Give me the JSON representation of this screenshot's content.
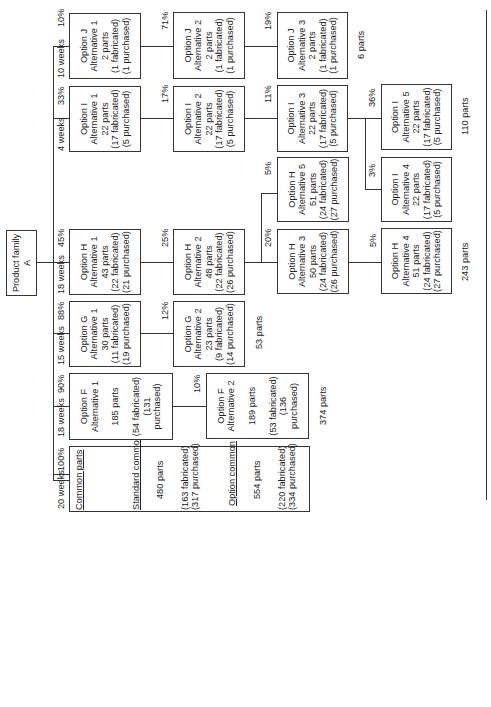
{
  "root": {
    "label": "Product family A"
  },
  "columns": [
    {
      "weeks": "20 weeks",
      "pct": "100%"
    },
    {
      "weeks": "18 weeks",
      "pct": "90%"
    },
    {
      "weeks": "15 weeks",
      "pct": "88%"
    },
    {
      "weeks": "18 weeks",
      "pct": "45%"
    },
    {
      "weeks": "4 weeks",
      "pct": "33%"
    },
    {
      "weeks": "10 weeks",
      "pct": "10%"
    }
  ],
  "common": {
    "title": "Common parts",
    "standard": {
      "title": "Standard common",
      "parts": "480 parts",
      "fab": "(163 fabricated)",
      "pur": "(317 purchased)"
    },
    "option": {
      "title": "Option common",
      "parts": "554 parts",
      "fab": "(220 fabricated)",
      "pur": "(334 purchased)"
    }
  },
  "boxes": {
    "F1": {
      "opt": "Option F",
      "alt": "Alternative 1",
      "parts": "185 parts",
      "fab": "(54 fabricated)",
      "pur": "(131 purchased)"
    },
    "F2": {
      "opt": "Option F",
      "alt": "Alternative 2",
      "parts": "189 parts",
      "fab": "(53 fabricated)",
      "pur": "(136 purchased)",
      "pct": "10%"
    },
    "G1": {
      "opt": "Option G",
      "alt": "Alternative 1",
      "parts": "30 parts",
      "fab": "(11 fabricated)",
      "pur": "(19 purchased)"
    },
    "G2": {
      "opt": "Option G",
      "alt": "Alternative 2",
      "parts": "23 parts",
      "fab": "(9 fabricated)",
      "pur": "(14 purchased)",
      "pct": "12%"
    },
    "H1": {
      "opt": "Option H",
      "alt": "Alternative 1",
      "parts": "43 parts",
      "fab": "(22 fabricated)",
      "pur": "(21 purchased)"
    },
    "H2": {
      "opt": "Option H",
      "alt": "Alternative 2",
      "parts": "48 parts",
      "fab": "(22 fabricated)",
      "pur": "(26 purchased)",
      "pct": "25%"
    },
    "H3": {
      "opt": "Option H",
      "alt": "Alternative 3",
      "parts": "50 parts",
      "fab": "(24 fabricated)",
      "pur": "(26 purchased)",
      "pct": "20%"
    },
    "H4": {
      "opt": "Option H",
      "alt": "Alternative 4",
      "parts": "51 parts",
      "fab": "(24 fabricated)",
      "pur": "(27 purchased)",
      "pct": "5%"
    },
    "H5": {
      "opt": "Option H",
      "alt": "Alternative 5",
      "parts": "51 parts",
      "fab": "(24 fabricated)",
      "pur": "(27 purchased)",
      "pct": "5%"
    },
    "I1": {
      "opt": "Option I",
      "alt": "Alternative 1",
      "parts": "22 parts",
      "fab": "(17 fabricated)",
      "pur": "(5 purchased)"
    },
    "I2": {
      "opt": "Option I",
      "alt": "Alternative 2",
      "parts": "22 parts",
      "fab": "(17 fabricated)",
      "pur": "(5 purchased)",
      "pct": "17%"
    },
    "I3": {
      "opt": "Option I",
      "alt": "Alternative 3",
      "parts": "22 parts",
      "fab": "(17 fabricated)",
      "pur": "(5 purchased)",
      "pct": "11%"
    },
    "I4": {
      "opt": "Option I",
      "alt": "Alternative 4",
      "parts": "22 parts",
      "fab": "(17 fabricated)",
      "pur": "(5 purchased)",
      "pct": "3%"
    },
    "I5": {
      "opt": "Option I",
      "alt": "Alternative 5",
      "parts": "22 parts",
      "fab": "(17 fabricated)",
      "pur": "(5 purchased)",
      "pct": "36%"
    },
    "J1": {
      "opt": "Option J",
      "alt": "Alternative 1",
      "parts": "2 parts",
      "fab": "(1 fabricated)",
      "pur": "(1 purchased)"
    },
    "J2": {
      "opt": "Option J",
      "alt": "Alternative 2",
      "parts": "2 parts",
      "fab": "(1 fabricated)",
      "pur": "(1 purchased)",
      "pct": "71%"
    },
    "J3": {
      "opt": "Option J",
      "alt": "Alternative 3",
      "parts": "2 parts",
      "fab": "(1 fabricated)",
      "pur": "(1 purchased)",
      "pct": "19%"
    }
  },
  "totals": {
    "F": "374 parts",
    "G": "53 parts",
    "H": "243 parts",
    "I": "110 parts",
    "J": "6 parts"
  }
}
